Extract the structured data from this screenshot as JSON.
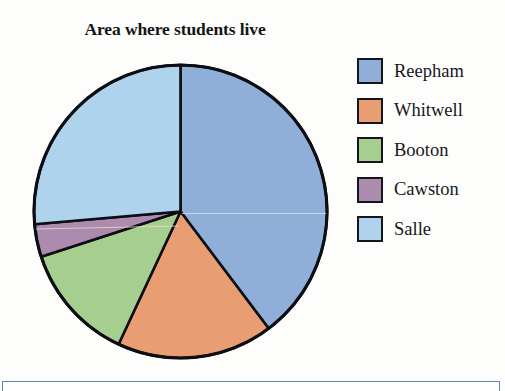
{
  "chart_data": {
    "type": "pie",
    "title": "Area where students live",
    "categories": [
      "Reepham",
      "Whitwell",
      "Booton",
      "Cawston",
      "Salle"
    ],
    "values": [
      40,
      17,
      13,
      4,
      26
    ],
    "units": "percent",
    "angles_deg": [
      143,
      62,
      47,
      13,
      95
    ],
    "start_angle_deg": 0,
    "direction": "clockwise",
    "colors": [
      "#8FAFD8",
      "#E99D72",
      "#A6CE8E",
      "#AC8BAE",
      "#AFD3EC"
    ],
    "legend_position": "right",
    "grid": false,
    "xlabel": "",
    "ylabel": ""
  },
  "legend": {
    "items": [
      {
        "label": "Reepham",
        "color": "#8FAFD8"
      },
      {
        "label": "Whitwell",
        "color": "#E99D72"
      },
      {
        "label": "Booton",
        "color": "#A6CE8E"
      },
      {
        "label": "Cawston",
        "color": "#AC8BAE"
      },
      {
        "label": "Salle",
        "color": "#AFD3EC"
      }
    ]
  }
}
